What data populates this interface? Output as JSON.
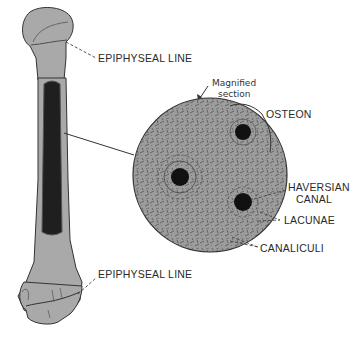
{
  "diagram": {
    "bone_labels": {
      "top_epiphyseal": "EPIPHYSEAL LINE",
      "bottom_epiphyseal": "EPIPHYSEAL LINE"
    },
    "magnified_label_line1": "Magnified",
    "magnified_label_line2": "section",
    "section_labels": {
      "osteon": "OSTEON",
      "haversian_line1": "HAVERSIAN",
      "haversian_line2": "CANAL",
      "lacunae": "LACUNAE",
      "canaliculi": "CANALICULI"
    },
    "colors": {
      "bone_fill": "#a8a8a8",
      "marrow_fill": "#1e1e1e",
      "section_fill": "#9a9a9a",
      "outline": "#333333"
    }
  }
}
